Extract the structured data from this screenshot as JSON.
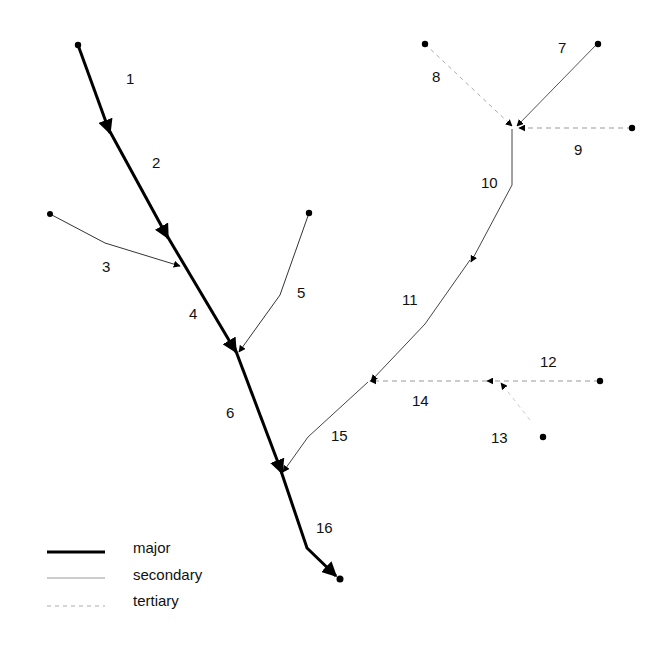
{
  "diagram": {
    "type": "stream-network",
    "segments": [
      {
        "id": "1",
        "class": "major",
        "label": "1"
      },
      {
        "id": "2",
        "class": "major",
        "label": "2"
      },
      {
        "id": "3",
        "class": "secondary",
        "label": "3"
      },
      {
        "id": "4",
        "class": "major",
        "label": "4"
      },
      {
        "id": "5",
        "class": "secondary",
        "label": "5"
      },
      {
        "id": "6",
        "class": "major",
        "label": "6"
      },
      {
        "id": "7",
        "class": "secondary",
        "label": "7"
      },
      {
        "id": "8",
        "class": "tertiary",
        "label": "8"
      },
      {
        "id": "9",
        "class": "tertiary",
        "label": "9"
      },
      {
        "id": "10",
        "class": "secondary",
        "label": "10"
      },
      {
        "id": "11",
        "class": "secondary",
        "label": "11"
      },
      {
        "id": "12",
        "class": "tertiary",
        "label": "12"
      },
      {
        "id": "13",
        "class": "tertiary",
        "label": "13"
      },
      {
        "id": "14",
        "class": "tertiary",
        "label": "14"
      },
      {
        "id": "15",
        "class": "secondary",
        "label": "15"
      },
      {
        "id": "16",
        "class": "major",
        "label": "16"
      }
    ],
    "legend": {
      "major": "major",
      "secondary": "secondary",
      "tertiary": "tertiary"
    }
  }
}
